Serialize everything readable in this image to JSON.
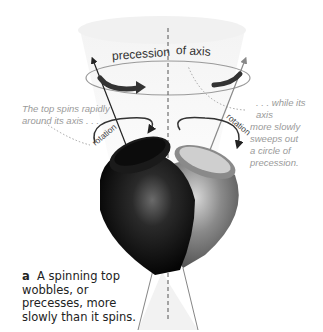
{
  "figure": {
    "title_left": "precession",
    "title_right": "of axis",
    "rotation_label_left": "rotation",
    "rotation_label_right": "rotation",
    "note_left": [
      "The top spins rapidly",
      "around its axis . . ."
    ],
    "note_right": [
      ". . . while its axis",
      "more slowly",
      "sweeps out",
      "a circle of",
      "precession."
    ],
    "caption_letter": "a",
    "caption_text": "A spinning top wobbles, or precesses, more slowly than it spins.",
    "colors": {
      "top_front": "#111111",
      "top_back": "#7a7a7a",
      "arrow": "#333333",
      "cone": "#f0f0f0",
      "note": "#9a9a9a"
    }
  }
}
